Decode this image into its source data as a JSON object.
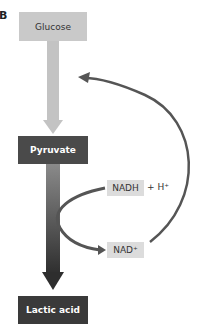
{
  "panel_label": "B",
  "nodes": {
    "glucose": "Glucose",
    "pyruvate": "Pyruvate",
    "lactic_acid": "Lactic acid",
    "nadh": "NADH",
    "hplus": "+ H⁺",
    "nad": "NAD⁺"
  },
  "colors": {
    "glucose_box": "#c9c9c9",
    "pyruvate_box": "#4a4a4a",
    "lactic_box": "#3a3a3a",
    "cofactor_box": "#dcdcdc",
    "arrow_light": "#c3c3c3",
    "arrow_dark": "#3c3c3c",
    "curve": "#555555"
  }
}
